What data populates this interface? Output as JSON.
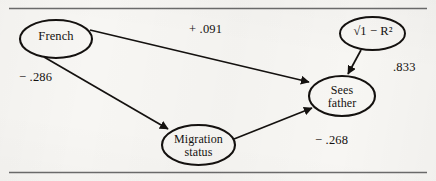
{
  "figure": {
    "kind": "path-diagram",
    "background_color": "#f7f6f3",
    "ink_color": "#14110f",
    "rule_color": "#6b6b6b"
  },
  "nodes": {
    "french": {
      "label": "French"
    },
    "migration": {
      "line1": "Migration",
      "line2": "status"
    },
    "sees_father": {
      "line1": "Sees",
      "line2": "father"
    },
    "residual": {
      "label": "√1 − R²"
    }
  },
  "path_labels": {
    "french_to_sees_father": "+ .091",
    "french_to_migration": "− .286",
    "migration_to_sees_father": "− .268",
    "residual_to_sees_father": ".833"
  },
  "edges": [
    {
      "from": "french",
      "to": "sees_father",
      "coefficient": "+ .091"
    },
    {
      "from": "french",
      "to": "migration",
      "coefficient": "− .286"
    },
    {
      "from": "migration",
      "to": "sees_father",
      "coefficient": "− .268"
    },
    {
      "from": "residual",
      "to": "sees_father",
      "coefficient": ".833"
    }
  ]
}
